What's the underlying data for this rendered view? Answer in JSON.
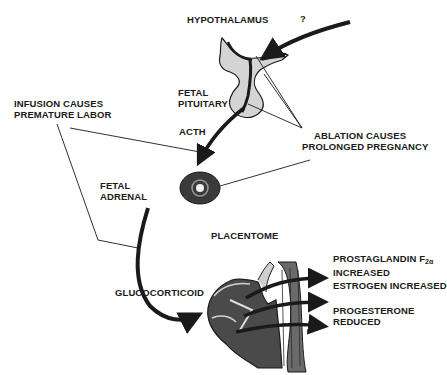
{
  "diagram": {
    "type": "physiological pathway",
    "labels": {
      "hypothalamus": "HYPOTHALAMUS",
      "question_mark": "?",
      "fetal_pituitary_line1": "FETAL",
      "fetal_pituitary_line2": "PITUITARY",
      "acth": "ACTH",
      "infusion_line1": "INFUSION CAUSES",
      "infusion_line2": "PREMATURE LABOR",
      "ablation_line1": "ABLATION CAUSES",
      "ablation_line2": "PROLONGED PREGNANCY",
      "fetal_adrenal_line1": "FETAL",
      "fetal_adrenal_line2": "ADRENAL",
      "placentome": "PLACENTOME",
      "glucocorticoid": "GLUCOCORTICOID",
      "prostaglandin_line1": "PROSTAGLANDIN F",
      "prostaglandin_sub": "2α",
      "prostaglandin_line2": "INCREASED",
      "estrogen": "ESTROGEN INCREASED",
      "progesterone_line1": "PROGESTERONE",
      "progesterone_line2": "REDUCED"
    },
    "flow": [
      {
        "from": "?",
        "to": "HYPOTHALAMUS"
      },
      {
        "from": "FETAL PITUITARY",
        "to": "FETAL ADRENAL",
        "via": "ACTH"
      },
      {
        "from": "FETAL ADRENAL",
        "to": "PLACENTOME",
        "via": "GLUCOCORTICOID"
      },
      {
        "from": "PLACENTOME",
        "to": "PROSTAGLANDIN F2α INCREASED"
      },
      {
        "from": "PLACENTOME",
        "to": "ESTROGEN INCREASED"
      },
      {
        "from": "PLACENTOME",
        "to": "PROGESTERONE REDUCED"
      }
    ],
    "colors": {
      "ink": "#1a1a1a",
      "gland_fill": "#d4d4d4",
      "adrenal_fill": "#3a3a3a",
      "tissue_fill": "#4a4a4a"
    }
  }
}
